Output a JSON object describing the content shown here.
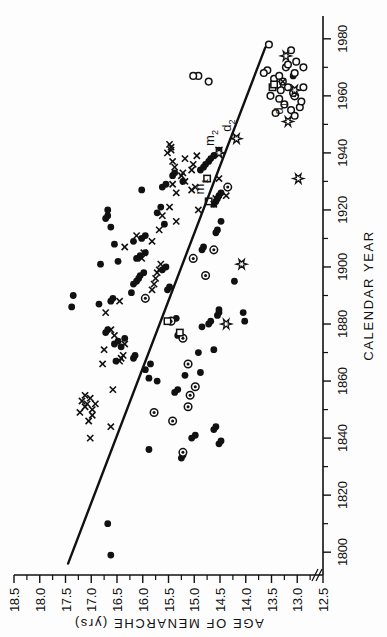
{
  "chart_data": {
    "type": "scatter",
    "title": "",
    "xlabel": "CALENDAR YEAR",
    "ylabel": "AGE OF MENARCHE (yrs)",
    "xlim": [
      1792,
      1988
    ],
    "ylim": [
      12.5,
      18.5
    ],
    "grid": false,
    "legend_position": "inline-annotations",
    "x_ticks": [
      1800,
      1820,
      1840,
      1860,
      1880,
      1900,
      1920,
      1940,
      1960,
      1980
    ],
    "x_tick_labels": [
      "1800",
      "1820",
      "1840",
      "1860",
      "1880",
      "1900",
      "1920",
      "1940",
      "1960",
      "1980"
    ],
    "y_ticks": [
      12.5,
      13.0,
      13.5,
      14.0,
      14.5,
      15.0,
      15.5,
      16.0,
      16.5,
      17.0,
      17.5,
      18.0,
      18.5
    ],
    "y_tick_labels": [
      "12.5",
      "13.0",
      "13.5",
      "14.0",
      "14.5",
      "15.0",
      "15.5",
      "16.0",
      "16.5",
      "17.0",
      "17.5",
      "18.0",
      "18.5"
    ],
    "axis_break": true,
    "trend_line": {
      "name": "regression line",
      "x1": 1796,
      "y1": 17.45,
      "x2": 1977,
      "y2": 13.62
    },
    "annotations": [
      {
        "label": "m",
        "sub": "1",
        "x": 1923,
        "y": 14.72
      },
      {
        "label": "m",
        "sub": "2",
        "x": 1940,
        "y": 14.52
      },
      {
        "label": "d",
        "sub": "2",
        "x": 1945,
        "y": 14.18
      },
      {
        "label": "d",
        "sub": "1",
        "x": 1951,
        "y": 13.18
      }
    ],
    "series": [
      {
        "name": "filled-circle",
        "marker": "filled-circle",
        "points": [
          [
            1799,
            16.62
          ],
          [
            1810,
            16.68
          ],
          [
            1836,
            15.88
          ],
          [
            1833,
            15.25
          ],
          [
            1834,
            15.22
          ],
          [
            1840,
            15.05
          ],
          [
            1841,
            14.98
          ],
          [
            1843,
            14.62
          ],
          [
            1844,
            14.58
          ],
          [
            1838,
            14.52
          ],
          [
            1839,
            14.48
          ],
          [
            1856,
            15.38
          ],
          [
            1857,
            15.32
          ],
          [
            1860,
            15.72
          ],
          [
            1861,
            15.88
          ],
          [
            1862,
            15.18
          ],
          [
            1863,
            14.88
          ],
          [
            1864,
            15.95
          ],
          [
            1866,
            15.85
          ],
          [
            1867,
            16.52
          ],
          [
            1868,
            16.18
          ],
          [
            1869,
            16.15
          ],
          [
            1870,
            14.92
          ],
          [
            1871,
            14.62
          ],
          [
            1872,
            16.42
          ],
          [
            1873,
            16.55
          ],
          [
            1874,
            16.48
          ],
          [
            1875,
            16.35
          ],
          [
            1876,
            15.32
          ],
          [
            1877,
            16.72
          ],
          [
            1878,
            16.68
          ],
          [
            1879,
            14.85
          ],
          [
            1880,
            14.72
          ],
          [
            1881,
            14.68
          ],
          [
            1882,
            15.35
          ],
          [
            1883,
            14.55
          ],
          [
            1884,
            14.52
          ],
          [
            1885,
            14.52
          ],
          [
            1886,
            17.38
          ],
          [
            1887,
            16.85
          ],
          [
            1888,
            16.62
          ],
          [
            1889,
            16.58
          ],
          [
            1890,
            17.35
          ],
          [
            1891,
            16.22
          ],
          [
            1892,
            15.52
          ],
          [
            1893,
            15.48
          ],
          [
            1894,
            16.18
          ],
          [
            1895,
            16.12
          ],
          [
            1896,
            16.08
          ],
          [
            1897,
            16.05
          ],
          [
            1898,
            15.98
          ],
          [
            1899,
            15.62
          ],
          [
            1900,
            15.55
          ],
          [
            1901,
            16.82
          ],
          [
            1902,
            16.48
          ],
          [
            1903,
            16.12
          ],
          [
            1904,
            16.05
          ],
          [
            1905,
            15.95
          ],
          [
            1906,
            14.85
          ],
          [
            1907,
            14.82
          ],
          [
            1908,
            16.55
          ],
          [
            1909,
            16.18
          ],
          [
            1910,
            16.02
          ],
          [
            1911,
            15.95
          ],
          [
            1912,
            14.58
          ],
          [
            1913,
            14.55
          ],
          [
            1914,
            16.62
          ],
          [
            1915,
            15.58
          ],
          [
            1916,
            14.48
          ],
          [
            1917,
            16.72
          ],
          [
            1918,
            16.68
          ],
          [
            1919,
            15.72
          ],
          [
            1920,
            16.68
          ],
          [
            1921,
            15.65
          ],
          [
            1922,
            14.62
          ],
          [
            1923,
            14.58
          ],
          [
            1924,
            14.55
          ],
          [
            1925,
            14.52
          ],
          [
            1926,
            14.48
          ],
          [
            1927,
            16.02
          ],
          [
            1928,
            15.62
          ],
          [
            1929,
            15.55
          ],
          [
            1930,
            15.22
          ],
          [
            1932,
            15.42
          ],
          [
            1933,
            15.38
          ],
          [
            1934,
            14.88
          ],
          [
            1935,
            14.82
          ],
          [
            1936,
            14.78
          ],
          [
            1937,
            14.72
          ],
          [
            1938,
            14.68
          ],
          [
            1939,
            14.62
          ],
          [
            1941,
            14.52
          ],
          [
            1881,
            14.02
          ],
          [
            1884,
            14.05
          ],
          [
            1895,
            14.22
          ],
          [
            1967,
            13.08
          ]
        ]
      },
      {
        "name": "circled-dot",
        "marker": "circled-dot",
        "points": [
          [
            1835,
            15.22
          ],
          [
            1846,
            15.42
          ],
          [
            1849,
            15.78
          ],
          [
            1851,
            15.12
          ],
          [
            1855,
            15.08
          ],
          [
            1858,
            14.98
          ],
          [
            1866,
            15.12
          ],
          [
            1875,
            15.22
          ],
          [
            1881,
            15.45
          ],
          [
            1889,
            15.95
          ],
          [
            1897,
            14.78
          ],
          [
            1903,
            15.02
          ],
          [
            1906,
            14.62
          ],
          [
            1928,
            14.35
          ],
          [
            1960,
            13.05
          ]
        ]
      },
      {
        "name": "open-circle",
        "marker": "open-circle",
        "points": [
          [
            1954,
            13.42
          ],
          [
            1955,
            13.12
          ],
          [
            1956,
            12.95
          ],
          [
            1957,
            13.25
          ],
          [
            1958,
            12.92
          ],
          [
            1959,
            13.35
          ],
          [
            1960,
            13.52
          ],
          [
            1961,
            13.08
          ],
          [
            1962,
            13.32
          ],
          [
            1963,
            13.18
          ],
          [
            1964,
            13.38
          ],
          [
            1965,
            13.28
          ],
          [
            1966,
            13.45
          ],
          [
            1967,
            13.35
          ],
          [
            1968,
            13.05
          ],
          [
            1969,
            13.58
          ],
          [
            1970,
            13.22
          ],
          [
            1971,
            13.18
          ],
          [
            1972,
            13.02
          ],
          [
            1967,
            14.92
          ],
          [
            1965,
            14.72
          ],
          [
            1967,
            15.02
          ],
          [
            1978,
            13.55
          ],
          [
            1976,
            13.12
          ],
          [
            1968,
            13.65
          ],
          [
            1970,
            12.88
          ],
          [
            1963,
            12.88
          ],
          [
            1953,
            13.05
          ]
        ]
      },
      {
        "name": "open-square",
        "marker": "open-square",
        "points": [
          [
            1877,
            15.28
          ],
          [
            1881,
            15.52
          ],
          [
            1923,
            14.72
          ],
          [
            1931,
            14.75
          ],
          [
            1963,
            13.48
          ],
          [
            1964,
            13.45
          ]
        ]
      },
      {
        "name": "x-mark",
        "marker": "x",
        "points": [
          [
            1840,
            17.02
          ],
          [
            1846,
            17.05
          ],
          [
            1849,
            17.22
          ],
          [
            1850,
            16.98
          ],
          [
            1851,
            17.12
          ],
          [
            1852,
            17.08
          ],
          [
            1853,
            17.18
          ],
          [
            1854,
            17.02
          ],
          [
            1855,
            17.12
          ],
          [
            1848,
            16.98
          ],
          [
            1852,
            16.92
          ],
          [
            1844,
            16.62
          ],
          [
            1857,
            16.58
          ],
          [
            1866,
            16.78
          ],
          [
            1867,
            16.45
          ],
          [
            1868,
            16.42
          ],
          [
            1869,
            16.38
          ],
          [
            1871,
            16.75
          ],
          [
            1873,
            16.35
          ],
          [
            1876,
            16.55
          ],
          [
            1878,
            16.62
          ],
          [
            1884,
            16.72
          ],
          [
            1888,
            16.45
          ],
          [
            1892,
            15.82
          ],
          [
            1894,
            15.78
          ],
          [
            1896,
            15.75
          ],
          [
            1898,
            15.72
          ],
          [
            1899,
            15.68
          ],
          [
            1901,
            15.65
          ],
          [
            1903,
            16.02
          ],
          [
            1905,
            15.98
          ],
          [
            1907,
            16.35
          ],
          [
            1909,
            15.82
          ],
          [
            1911,
            16.12
          ],
          [
            1913,
            15.68
          ],
          [
            1916,
            15.35
          ],
          [
            1918,
            15.62
          ],
          [
            1920,
            14.92
          ],
          [
            1921,
            15.48
          ],
          [
            1922,
            14.62
          ],
          [
            1924,
            14.58
          ],
          [
            1926,
            15.35
          ],
          [
            1927,
            15.05
          ],
          [
            1928,
            14.98
          ],
          [
            1929,
            15.42
          ],
          [
            1930,
            15.18
          ],
          [
            1931,
            14.52
          ],
          [
            1932,
            15.25
          ],
          [
            1933,
            15.22
          ],
          [
            1934,
            15.05
          ],
          [
            1935,
            15.38
          ],
          [
            1936,
            15.02
          ],
          [
            1937,
            15.42
          ],
          [
            1938,
            15.18
          ],
          [
            1939,
            14.95
          ],
          [
            1940,
            15.52
          ],
          [
            1941,
            15.45
          ],
          [
            1942,
            15.45
          ],
          [
            1943,
            15.48
          ],
          [
            1925,
            14.38
          ],
          [
            1941,
            14.52
          ],
          [
            1965,
            13.28
          ]
        ]
      },
      {
        "name": "star",
        "marker": "star",
        "points": [
          [
            1880,
            14.38
          ],
          [
            1901,
            14.08
          ],
          [
            1931,
            12.98
          ],
          [
            1940,
            14.52
          ],
          [
            1945,
            14.18
          ],
          [
            1951,
            13.18
          ],
          [
            1962,
            13.05
          ],
          [
            1974,
            13.22
          ]
        ]
      }
    ]
  }
}
